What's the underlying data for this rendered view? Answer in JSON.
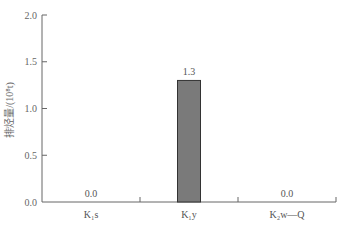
{
  "chart_data": {
    "type": "bar",
    "title": "",
    "xlabel": "",
    "ylabel": "排烃量/(10⁸t)",
    "categories": [
      "K₁s",
      "K₁y",
      "K₂w—Q"
    ],
    "values": [
      0.0,
      1.3,
      0.0
    ],
    "value_labels": [
      "0.0",
      "1.3",
      "0.0"
    ],
    "ylim": [
      0,
      2.0
    ],
    "yticks": [
      0.0,
      0.5,
      1.0,
      1.5,
      2.0
    ],
    "ytick_labels": [
      "0.0",
      "0.5",
      "1.0",
      "1.5",
      "2.0"
    ],
    "grid": false,
    "legend": null,
    "bar_color": "#7a7a7a",
    "bar_edge_color": "#333333",
    "axis_color": "#666666"
  }
}
